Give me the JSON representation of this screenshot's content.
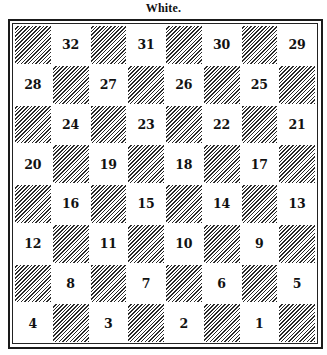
{
  "title": "White.",
  "board": {
    "rows": 8,
    "cols": 8,
    "hatch_color": "#2a2a2a",
    "light_color": "#ffffff",
    "squares": [
      [
        {
          "type": "dark"
        },
        {
          "type": "light",
          "num": "32"
        },
        {
          "type": "dark"
        },
        {
          "type": "light",
          "num": "31"
        },
        {
          "type": "dark"
        },
        {
          "type": "light",
          "num": "30"
        },
        {
          "type": "dark"
        },
        {
          "type": "light",
          "num": "29"
        }
      ],
      [
        {
          "type": "light",
          "num": "28"
        },
        {
          "type": "dark"
        },
        {
          "type": "light",
          "num": "27"
        },
        {
          "type": "dark"
        },
        {
          "type": "light",
          "num": "26"
        },
        {
          "type": "dark"
        },
        {
          "type": "light",
          "num": "25"
        },
        {
          "type": "dark"
        }
      ],
      [
        {
          "type": "dark"
        },
        {
          "type": "light",
          "num": "24"
        },
        {
          "type": "dark"
        },
        {
          "type": "light",
          "num": "23"
        },
        {
          "type": "dark"
        },
        {
          "type": "light",
          "num": "22"
        },
        {
          "type": "dark"
        },
        {
          "type": "light",
          "num": "21"
        }
      ],
      [
        {
          "type": "light",
          "num": "20"
        },
        {
          "type": "dark"
        },
        {
          "type": "light",
          "num": "19"
        },
        {
          "type": "dark"
        },
        {
          "type": "light",
          "num": "18"
        },
        {
          "type": "dark"
        },
        {
          "type": "light",
          "num": "17"
        },
        {
          "type": "dark"
        }
      ],
      [
        {
          "type": "dark"
        },
        {
          "type": "light",
          "num": "16"
        },
        {
          "type": "dark"
        },
        {
          "type": "light",
          "num": "15"
        },
        {
          "type": "dark"
        },
        {
          "type": "light",
          "num": "14"
        },
        {
          "type": "dark"
        },
        {
          "type": "light",
          "num": "13"
        }
      ],
      [
        {
          "type": "light",
          "num": "12"
        },
        {
          "type": "dark"
        },
        {
          "type": "light",
          "num": "11"
        },
        {
          "type": "dark"
        },
        {
          "type": "light",
          "num": "10"
        },
        {
          "type": "dark"
        },
        {
          "type": "light",
          "num": "9"
        },
        {
          "type": "dark"
        }
      ],
      [
        {
          "type": "dark"
        },
        {
          "type": "light",
          "num": "8"
        },
        {
          "type": "dark"
        },
        {
          "type": "light",
          "num": "7"
        },
        {
          "type": "dark"
        },
        {
          "type": "light",
          "num": "6"
        },
        {
          "type": "dark"
        },
        {
          "type": "light",
          "num": "5"
        }
      ],
      [
        {
          "type": "light",
          "num": "4"
        },
        {
          "type": "dark"
        },
        {
          "type": "light",
          "num": "3"
        },
        {
          "type": "dark"
        },
        {
          "type": "light",
          "num": "2"
        },
        {
          "type": "dark"
        },
        {
          "type": "light",
          "num": "1"
        },
        {
          "type": "dark"
        }
      ]
    ]
  }
}
